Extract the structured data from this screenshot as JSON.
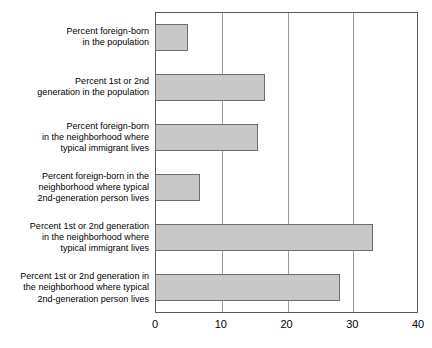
{
  "chart_data": {
    "type": "bar",
    "orientation": "horizontal",
    "title": "",
    "subtitle": "",
    "xlabel": "",
    "ylabel": "",
    "xlim": [
      0,
      40
    ],
    "xticks": [
      "0",
      "10",
      "20",
      "30",
      "40"
    ],
    "xtick_values": [
      0,
      10,
      20,
      30,
      40
    ],
    "grid": "vertical",
    "legend": "none",
    "bar_fill_color": "#c8c8c8",
    "bar_border_color": "#6e6e6e",
    "axis_color": "#5a5a5a",
    "gridline_color": "#9b9b9b",
    "categories": [
      "Percent foreign-born\nin the population",
      "Percent 1st or 2nd\ngeneration in the population",
      "Percent foreign-born\nin the neighborhood where\ntypical immigrant lives",
      "Percent foreign-born in the\nneighborhood where typical\n2nd-generation person lives",
      "Percent 1st or 2nd generation\nin the neighborhood where\ntypical immigrant lives",
      "Percent 1st or 2nd generation in\nthe neighborhood where typical\n2nd-generation person lives"
    ],
    "values": [
      5.0,
      16.8,
      15.6,
      6.8,
      33.1,
      28.1
    ]
  }
}
